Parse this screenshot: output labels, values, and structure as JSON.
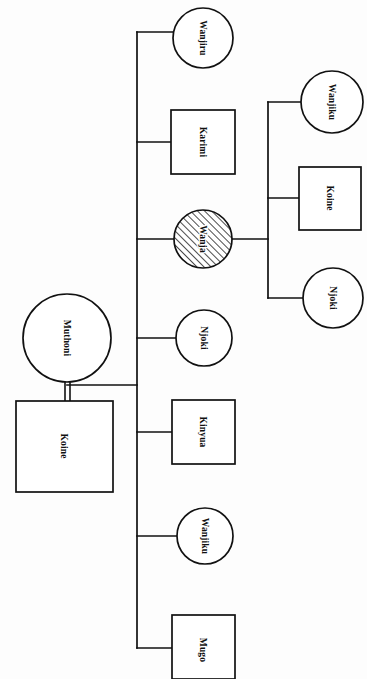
{
  "diagram": {
    "type": "kinship-genealogy-chart",
    "orientation": "rotated-90-labels",
    "background_color": "#fdfdfd",
    "line_color": "#111111",
    "node_fill_color": "#ffffff",
    "index_person": "Wanja",
    "index_marker": "diagonal-hatching"
  },
  "nodes": {
    "parent_female": {
      "label": "Muthoni",
      "shape": "circle",
      "sex": "female"
    },
    "parent_male": {
      "label": "Koine",
      "shape": "square",
      "sex": "male"
    },
    "child_1": {
      "label": "Wanjiru",
      "shape": "circle",
      "sex": "female"
    },
    "child_2": {
      "label": "Karimi",
      "shape": "square",
      "sex": "male"
    },
    "child_3": {
      "label": "Wanja",
      "shape": "circle",
      "sex": "female",
      "hatched": true
    },
    "child_4": {
      "label": "Njoki",
      "shape": "circle",
      "sex": "female"
    },
    "child_5": {
      "label": "Kinyua",
      "shape": "square",
      "sex": "male"
    },
    "child_6": {
      "label": "Wanjiku",
      "shape": "circle",
      "sex": "female"
    },
    "child_7": {
      "label": "Mugo",
      "shape": "square",
      "sex": "male"
    },
    "grandchild_1": {
      "label": "Wanjiku",
      "shape": "circle",
      "sex": "female"
    },
    "grandchild_2": {
      "label": "Koine",
      "shape": "square",
      "sex": "male"
    },
    "grandchild_3": {
      "label": "Njoki",
      "shape": "circle",
      "sex": "female"
    }
  }
}
